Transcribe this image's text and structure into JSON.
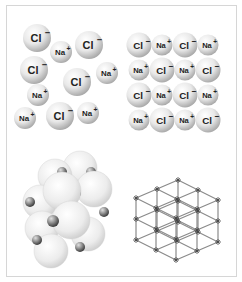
{
  "figure": {
    "panels": [
      {
        "id": "disordered-ions",
        "description": "Loose arrangement of Na+ and Cl- ions",
        "ions": [
          {
            "label": "Cl",
            "charge": "−",
            "x": 37,
            "y": 38,
            "r": 14
          },
          {
            "label": "Na",
            "charge": "+",
            "x": 61,
            "y": 52,
            "r": 11
          },
          {
            "label": "Cl",
            "charge": "−",
            "x": 89,
            "y": 45,
            "r": 14
          },
          {
            "label": "Cl",
            "charge": "−",
            "x": 34,
            "y": 70,
            "r": 14
          },
          {
            "label": "Cl",
            "charge": "−",
            "x": 77,
            "y": 82,
            "r": 14
          },
          {
            "label": "Na",
            "charge": "+",
            "x": 107,
            "y": 73,
            "r": 11
          },
          {
            "label": "Na",
            "charge": "+",
            "x": 38,
            "y": 95,
            "r": 11
          },
          {
            "label": "Na",
            "charge": "+",
            "x": 25,
            "y": 118,
            "r": 11
          },
          {
            "label": "Cl",
            "charge": "−",
            "x": 60,
            "y": 116,
            "r": 14
          },
          {
            "label": "Na",
            "charge": "+",
            "x": 88,
            "y": 113,
            "r": 11
          }
        ]
      },
      {
        "id": "ordered-lattice-layer",
        "description": "Ordered 4x4 alternating layer of Na+ and Cl- ions",
        "grid": [
          [
            "Cl-",
            "Na+",
            "Cl-",
            "Na+"
          ],
          [
            "Na+",
            "Cl-",
            "Na+",
            "Cl-"
          ],
          [
            "Cl-",
            "Na+",
            "Cl-",
            "Na+"
          ],
          [
            "Na+",
            "Cl-",
            "Na+",
            "Cl-"
          ]
        ],
        "col_x": [
          139,
          162,
          185,
          208
        ],
        "row_y": [
          45,
          70,
          95,
          120
        ]
      },
      {
        "id": "space-filling-model",
        "description": "Space-filling model of NaCl crystal (large Cl- spheres, small Na+ spheres)"
      },
      {
        "id": "ball-and-stick-lattice",
        "description": "Cubic crystal lattice framework of NaCl"
      }
    ],
    "colors": {
      "frame": "#d6d6d6",
      "sphere_light": "#ffffff",
      "sphere_mid": "#e6e6e6",
      "sphere_dark": "#9a9a9a",
      "small_sphere_dark": "#555555",
      "lattice_line": "#8a8a8a",
      "label": "#222222"
    }
  }
}
